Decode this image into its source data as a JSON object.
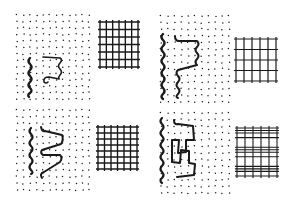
{
  "figure": {
    "background": "#ffffff",
    "ink": "#1a1a1a",
    "panels": [
      {
        "id": "top-left",
        "dots": {
          "x": 17,
          "y": 15,
          "w": 72,
          "h": 84,
          "cols": 12,
          "rows": 14
        },
        "wavy_lines": [
          {
            "d": "M30,58 q-3,3 0,6 q3,3 0,6 q-3,3 0,6 q3,3 0,6 q-3,3 0,6 q3,3 0,5 q-3,2 -1,4",
            "width": 2.4
          },
          {
            "d": "M43,57 L60,58 q3,2 0,5 q-3,3 0,6 q3,3 0,6 q-2,2 -1,4 L49,77 q-6,0 -5,5 q2,2 4,0",
            "width": 1.6
          }
        ],
        "grid": {
          "x": 98,
          "y": 20,
          "w": 42,
          "h": 49,
          "vlines": 7,
          "hlines": 7,
          "double_h": [],
          "width": 1.4
        }
      },
      {
        "id": "top-right",
        "dots": {
          "x": 161,
          "y": 16,
          "w": 68,
          "h": 86,
          "cols": 11,
          "rows": 14
        },
        "wavy_lines": [
          {
            "d": "M163,34 q-3,3 0,6 q3,3 0,6 q-3,3 0,6 q3,3 0,6 q-3,3 0,6 q3,3 0,6 q-3,3 0,6 q3,3 0,6 q-3,3 0,6 q3,3 0,6 q-3,3 0,5",
            "width": 2.4
          },
          {
            "d": "M175,36 q0,5 4,5 L197,41 q3,3 0,6 q-3,3 0,6 q3,3 0,6 q-3,3 0,6 L178,70 q-3,3 0,6 q3,3 0,6 q-3,3 0,6 q3,3 0,6 q-3,3 0,4",
            "width": 2.0
          }
        ],
        "grid": {
          "x": 234,
          "y": 37,
          "w": 44,
          "h": 46,
          "vlines": 6,
          "hlines": 5,
          "double_h": [],
          "width": 1.2
        }
      },
      {
        "id": "bottom-left",
        "dots": {
          "x": 17,
          "y": 110,
          "w": 72,
          "h": 80,
          "cols": 12,
          "rows": 13
        },
        "wavy_lines": [
          {
            "d": "M31,128 q-3,3 0,6 q3,3 0,6 q-3,3 0,6 q3,3 0,6 q-3,3 0,6 q3,3 0,6 q-3,3 0,6 q3,3 0,4",
            "width": 2.2
          },
          {
            "d": "M41,127 q1,5 4,4 L62,135 q2,5 -1,9 L42,150 q-2,3 1,5 L60,155 q3,3 0,7 L44,172 q-5,2 -2,6",
            "width": 2.0
          }
        ],
        "grid": {
          "x": 96,
          "y": 125,
          "w": 43,
          "h": 46,
          "vlines": 7,
          "hlines": 8,
          "double_h": [],
          "width": 1.4
        }
      },
      {
        "id": "bottom-right",
        "dots": {
          "x": 161,
          "y": 113,
          "w": 68,
          "h": 80,
          "cols": 11,
          "rows": 13
        },
        "wavy_lines": [
          {
            "d": "M162,118 q-3,3 0,6 q3,3 0,6 q-3,3 0,6 q3,3 0,6 q-3,3 0,6 q3,3 0,6 q-3,3 0,6 q3,3 0,6 q-3,3 0,6 q3,3 0,6 q-3,3 0,5",
            "width": 2.2
          },
          {
            "d": "M174,120 q0,5 4,4 L193,126 L194,140 L186,140 L186,152 L178,153 L179,140 L172,140 L172,162 L180,163 L181,150 L189,151 L189,163 L195,164 L194,175 L177,177",
            "width": 2.0
          }
        ],
        "grid": {
          "x": 235,
          "y": 126,
          "w": 44,
          "h": 52,
          "vlines": 6,
          "hlines": 6,
          "double_h": [
            0,
            2,
            4
          ],
          "width": 1.1
        }
      }
    ]
  }
}
